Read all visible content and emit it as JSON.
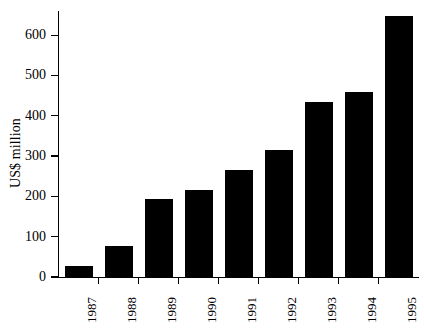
{
  "chart_data": {
    "type": "bar",
    "title": "",
    "subtitle": "",
    "xlabel": "",
    "ylabel": "US$ million",
    "categories": [
      "1987",
      "1988",
      "1989",
      "1990",
      "1991",
      "1992",
      "1993",
      "1994",
      "1995"
    ],
    "values": [
      27,
      76,
      193,
      217,
      266,
      315,
      435,
      460,
      647
    ],
    "ylim": [
      0,
      660
    ],
    "yticks": [
      0,
      100,
      200,
      300,
      400,
      500,
      600
    ],
    "ytick_labels": [
      "0",
      "100",
      "200",
      "300",
      "400",
      "500",
      "600"
    ],
    "grid": false,
    "legend": null,
    "bar_color": "#000000",
    "background_color": "#ffffff",
    "axis_color": "#000000"
  },
  "axes": {
    "y_title": "US$ million"
  }
}
